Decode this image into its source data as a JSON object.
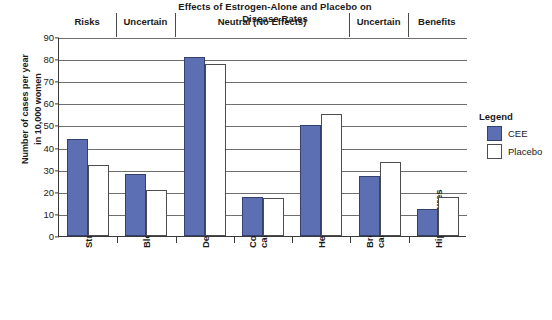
{
  "chart_data": {
    "type": "bar",
    "title": "Effects of Estrogen-Alone and Placebo on Disease Rates",
    "title_line1": "Effects of Estrogen-Alone and Placebo on",
    "title_line2": "Disease Rates",
    "xlabel": "",
    "ylabel": "Number of cases per year in 10,000 women",
    "ylabel_line1": "Number of cases per year",
    "ylabel_line2": "in 10,000 women",
    "ylim": [
      0,
      90
    ],
    "ytick_step": 10,
    "yticks": [
      0,
      10,
      20,
      30,
      40,
      50,
      60,
      70,
      80,
      90
    ],
    "grid": "horizontal",
    "legend_position": "right",
    "legend_title": "Legend",
    "categories": [
      "Strokes",
      "Blood clots",
      "Deaths",
      "Colorectal cancer",
      "Heart attacks",
      "Breast cancer",
      "Hip fractures"
    ],
    "category_lines": [
      [
        "Strokes"
      ],
      [
        "Blood clots"
      ],
      [
        "Deaths"
      ],
      [
        "Colorectal",
        "cancer"
      ],
      [
        "Heart attacks"
      ],
      [
        "Breast",
        "cancer"
      ],
      [
        "Hip fractures"
      ]
    ],
    "series": [
      {
        "name": "CEE",
        "color": "#5c6fb2",
        "values": [
          44,
          28,
          81,
          17.5,
          50,
          27,
          12
        ]
      },
      {
        "name": "Placebo",
        "color": "#ffffff",
        "values": [
          32,
          21,
          78,
          17,
          55,
          33.5,
          17.5
        ]
      }
    ],
    "bands": [
      {
        "label": "Risks",
        "start_category": 0,
        "end_category": 0
      },
      {
        "label": "Uncertain",
        "start_category": 1,
        "end_category": 1
      },
      {
        "label": "Neutral (No Effects)",
        "start_category": 2,
        "end_category": 4
      },
      {
        "label": "Uncertain",
        "start_category": 5,
        "end_category": 5
      },
      {
        "label": "Benefits",
        "start_category": 6,
        "end_category": 6
      }
    ]
  }
}
